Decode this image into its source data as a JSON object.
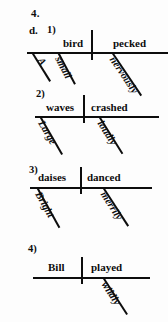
{
  "worksheet": {
    "exercise_number": "4.",
    "sub_item": "d."
  },
  "diagrams": [
    {
      "label": "1)",
      "subject": "bird",
      "predicate": "pecked",
      "subject_modifiers": [
        "A",
        "small"
      ],
      "predicate_modifiers": [
        "nervously"
      ]
    },
    {
      "label": "2)",
      "subject": "waves",
      "predicate": "crashed",
      "subject_modifiers": [
        "Large"
      ],
      "predicate_modifiers": [
        "loudly"
      ]
    },
    {
      "label": "3)",
      "subject": "daises",
      "predicate": "danced",
      "subject_modifiers": [
        "Bright"
      ],
      "predicate_modifiers": [
        "merrily"
      ]
    },
    {
      "label": "4)",
      "subject": "Bill",
      "predicate": "played",
      "subject_modifiers": [],
      "predicate_modifiers": [
        "wildly"
      ]
    }
  ],
  "colors": {
    "ink": "#0d0d0d",
    "paper": "#fdfdfd"
  }
}
